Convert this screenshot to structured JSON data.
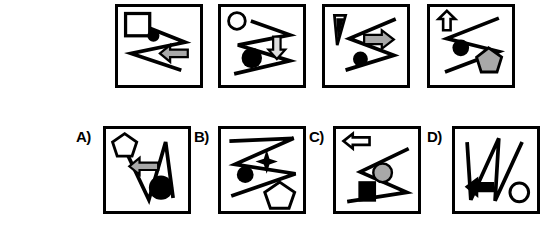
{
  "puzzle": {
    "kind": "visual-analogy-multiple-choice",
    "stimulus_count": 4,
    "option_count": 4,
    "colors": {
      "stroke": "#000000",
      "background": "#ffffff",
      "gray_fill": "#a8a8a8",
      "black_fill": "#000000"
    }
  },
  "stimuli": [
    {
      "id": "stimulus-1",
      "shapes": [
        "white-square",
        "zigzag-line-horizontal",
        "black-circle",
        "gray-left-arrow"
      ]
    },
    {
      "id": "stimulus-2",
      "shapes": [
        "white-circle",
        "zigzag-line-horizontal",
        "gray-down-arrow",
        "black-circle"
      ]
    },
    {
      "id": "stimulus-3",
      "shapes": [
        "black-triangle",
        "zigzag-line-horizontal",
        "gray-right-arrow",
        "black-circle"
      ]
    },
    {
      "id": "stimulus-4",
      "shapes": [
        "white-up-arrow",
        "zigzag-line-horizontal",
        "black-circle",
        "gray-pentagon"
      ]
    }
  ],
  "options": [
    {
      "id": "option-a",
      "label": "A)",
      "shapes": [
        "white-pentagon",
        "zigzag-line-vertical",
        "gray-left-arrow",
        "black-circle"
      ]
    },
    {
      "id": "option-b",
      "label": "B)",
      "shapes": [
        "zigzag-line-horizontal",
        "black-four-point-star",
        "black-circle",
        "white-pentagon"
      ]
    },
    {
      "id": "option-c",
      "label": "C)",
      "shapes": [
        "white-left-arrow",
        "zigzag-line-horizontal",
        "gray-circle",
        "black-square"
      ]
    },
    {
      "id": "option-d",
      "label": "D)",
      "shapes": [
        "zigzag-line-vertical",
        "black-left-arrow",
        "white-circle"
      ]
    }
  ]
}
